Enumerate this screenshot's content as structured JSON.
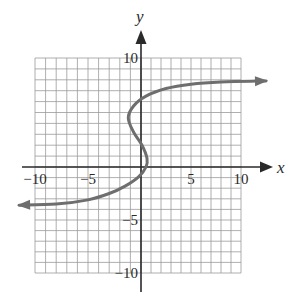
{
  "chart_data": {
    "type": "line",
    "title": "",
    "xlabel": "x",
    "ylabel": "y",
    "xlim": [
      -10,
      10
    ],
    "ylim": [
      -10,
      10
    ],
    "grid": true,
    "grid_step": 1,
    "x_ticks": [
      -10,
      -5,
      5,
      10
    ],
    "y_ticks": [
      10,
      -5,
      -10
    ],
    "x_tick_labels": [
      "−10",
      "−5",
      "5",
      "10"
    ],
    "y_tick_labels": [
      "10",
      "−5",
      "−10"
    ],
    "series": [
      {
        "name": "curve",
        "description": "S-shaped curve (x as a function of y) with horizontal asymptotes near y = -4 (left) and y = 8 (right), both ends arrowed",
        "color": "#6e6e6e",
        "points": [
          {
            "x": -11.5,
            "y": -3.6
          },
          {
            "x": -8,
            "y": -3.5
          },
          {
            "x": -5,
            "y": -3.1
          },
          {
            "x": -3,
            "y": -2.5
          },
          {
            "x": -1.5,
            "y": -1.8
          },
          {
            "x": -0.2,
            "y": -0.9
          },
          {
            "x": 0.5,
            "y": 0
          },
          {
            "x": 0.6,
            "y": 0.8
          },
          {
            "x": 0.1,
            "y": 2
          },
          {
            "x": -0.7,
            "y": 3.2
          },
          {
            "x": -1.2,
            "y": 4.5
          },
          {
            "x": -0.7,
            "y": 5.6
          },
          {
            "x": 0.5,
            "y": 6.5
          },
          {
            "x": 2.5,
            "y": 7.2
          },
          {
            "x": 5,
            "y": 7.6
          },
          {
            "x": 8,
            "y": 7.8
          },
          {
            "x": 12.5,
            "y": 7.9
          }
        ]
      }
    ],
    "legend": null
  },
  "axes": {
    "x_label": "x",
    "y_label": "y"
  },
  "colors": {
    "grid": "#9a9a9a",
    "axis": "#2a2a2a",
    "curve": "#6e6e6e"
  }
}
